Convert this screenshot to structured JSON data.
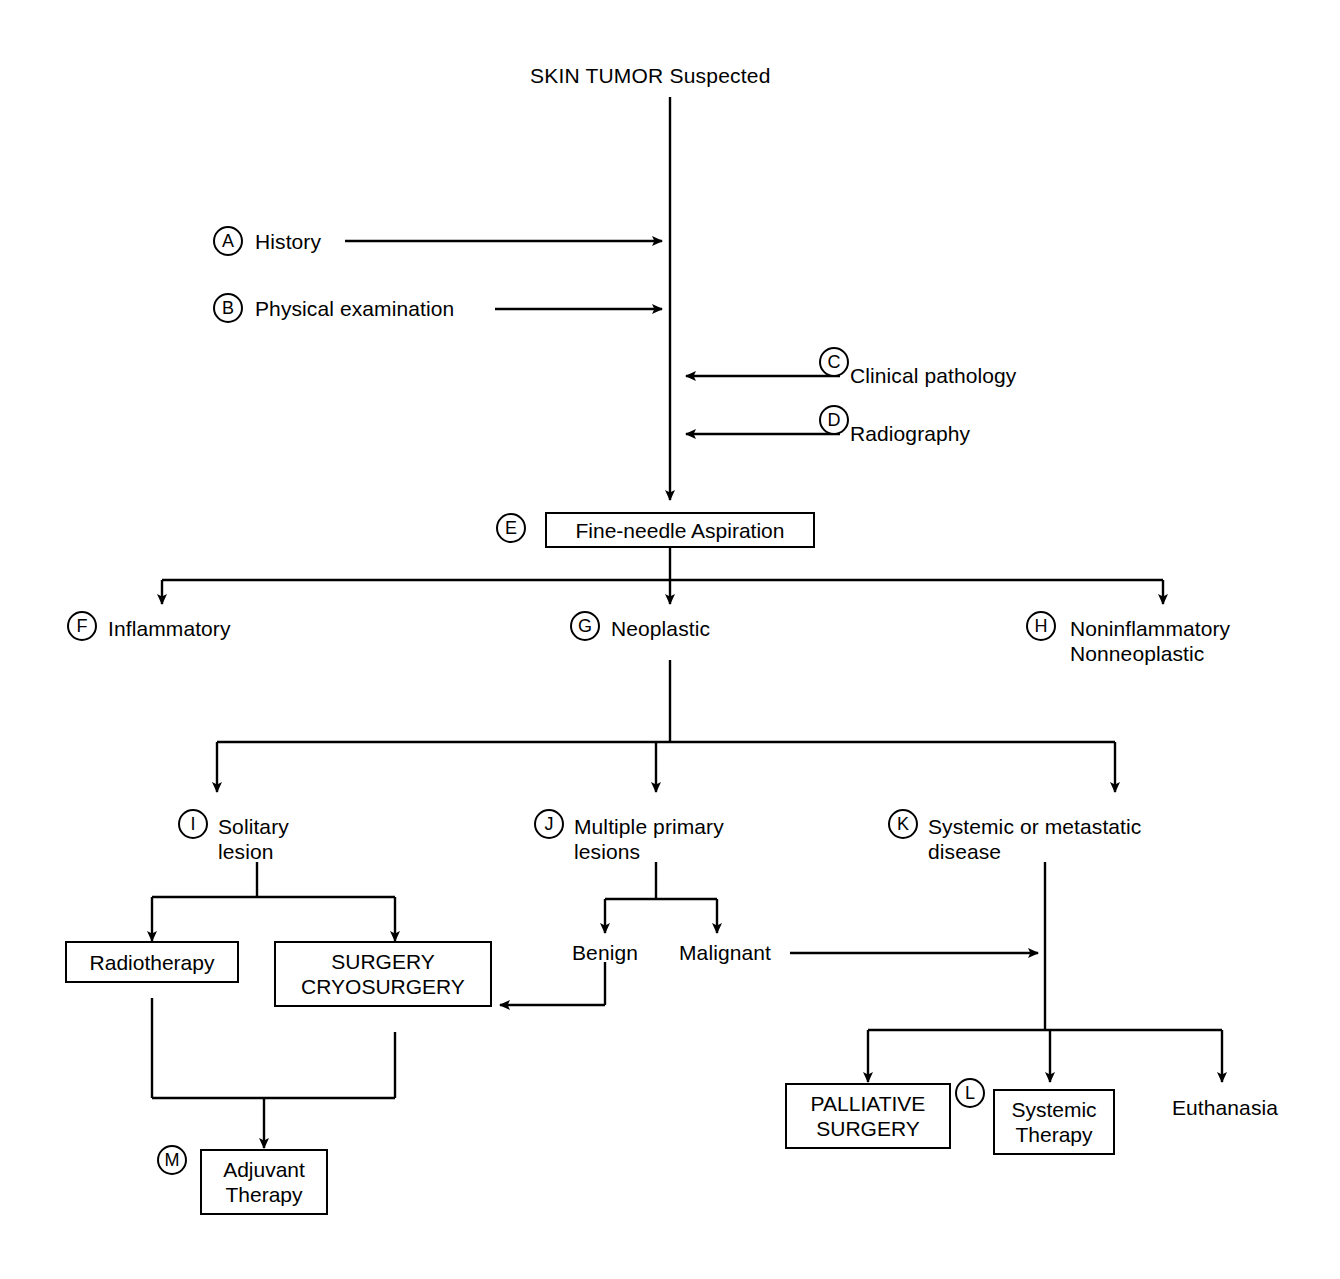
{
  "diagram": {
    "title": "SKIN TUMOR Suspected",
    "accent_color": "#000000",
    "background_color": "#ffffff",
    "markers": {
      "a": "A",
      "b": "B",
      "c": "C",
      "d": "D",
      "e": "E",
      "f": "F",
      "g": "G",
      "h": "H",
      "i": "I",
      "j": "J",
      "k": "K",
      "l": "L",
      "m": "M"
    },
    "nodes": {
      "history": "History",
      "physical_examination": "Physical examination",
      "clinical_pathology": "Clinical pathology",
      "radiography": "Radiography",
      "fine_needle_aspiration": "Fine-needle Aspiration",
      "inflammatory": "Inflammatory",
      "neoplastic": "Neoplastic",
      "noninflammatory_nonneoplastic": "Noninflammatory\nNonneoplastic",
      "solitary_lesion": "Solitary\nlesion",
      "multiple_primary_lesions": "Multiple primary\nlesions",
      "systemic_or_metastatic_disease": "Systemic or metastatic\ndisease",
      "benign": "Benign",
      "malignant": "Malignant",
      "radiotherapy": "Radiotherapy",
      "surgery_cryosurgery": "SURGERY\nCRYOSURGERY",
      "adjuvant_therapy": "Adjuvant\nTherapy",
      "palliative_surgery": "PALLIATIVE\nSURGERY",
      "systemic_therapy": "Systemic\nTherapy",
      "euthanasia": "Euthanasia"
    }
  }
}
